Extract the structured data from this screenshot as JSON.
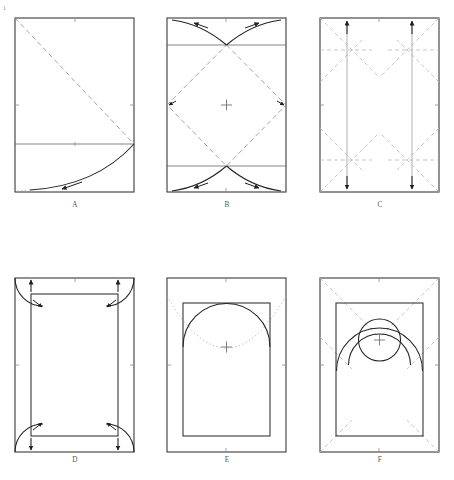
{
  "figure": {
    "canvas": {
      "width": 454,
      "height": 480
    },
    "corner_mark": "1",
    "stroke_colors": {
      "outline": "#3a3a3a",
      "inner_rect": "#2e2e2e",
      "fold_arc": "#232323",
      "guide": "#9a9a9a",
      "guide_dashed": "#8d8d8d",
      "guide_faint": "#b4b4b4",
      "label": "#555555",
      "background": "#ffffff"
    },
    "panels": [
      {
        "id": "A",
        "label": "A",
        "label_x": 75,
        "label_y": 207,
        "rect": {
          "x": 15,
          "y": 18,
          "w": 119,
          "h": 174
        },
        "description": "Diagonal fold from top-left corner to right edge midpoint with swing arc down to bottom edge",
        "horizontal_guide_y": 144,
        "diagonal": {
          "x1": 15,
          "y1": 18,
          "x2": 134,
          "y2": 144
        },
        "swing_arc": {
          "from_x": 134,
          "from_y": 144,
          "to_x": 30,
          "to_y": 190
        },
        "arrow_on_arc": true,
        "ticks": [
          {
            "x": 75,
            "y": 18,
            "dir": "v"
          },
          {
            "x": 15,
            "y": 105,
            "dir": "h"
          },
          {
            "x": 134,
            "y": 105,
            "dir": "h"
          },
          {
            "x": 75,
            "y": 192,
            "dir": "v"
          }
        ]
      },
      {
        "id": "B",
        "label": "B",
        "label_x": 227,
        "label_y": 207,
        "rect": {
          "x": 167,
          "y": 18,
          "w": 119,
          "h": 174
        },
        "description": "Diamond inscribed by four diagonals; arcs swing outward at top and bottom crossings",
        "horizontal_guide_top_y": 45,
        "horizontal_guide_bottom_y": 166,
        "diamond_points": "226.5,45 286,105 226.5,166 167,105",
        "center": {
          "x": 226.5,
          "y": 105
        },
        "arc_pairs": 2,
        "arrows": 4,
        "ticks": [
          {
            "x": 226,
            "y": 18,
            "dir": "v"
          },
          {
            "x": 226,
            "y": 192,
            "dir": "v"
          }
        ]
      },
      {
        "id": "C",
        "label": "C",
        "label_x": 380,
        "label_y": 207,
        "rect": {
          "x": 320,
          "y": 18,
          "w": 119,
          "h": 174
        },
        "description": "Two vertical fold lines with double-headed arrows; faint diagonal creases at each corner zone",
        "vertical_lines": [
          347,
          412
        ],
        "horizontal_crease_top_y": 50,
        "horizontal_crease_bottom_y": 160,
        "arrow_count": 4,
        "diagonal_guides": 8,
        "ticks": [
          {
            "x": 379,
            "y": 18,
            "dir": "v"
          },
          {
            "x": 320,
            "y": 105,
            "dir": "h"
          },
          {
            "x": 439,
            "y": 105,
            "dir": "h"
          }
        ]
      },
      {
        "id": "D",
        "label": "D",
        "label_x": 75,
        "label_y": 462,
        "rect": {
          "x": 15,
          "y": 278,
          "w": 119,
          "h": 174
        },
        "inner_rect": {
          "x": 31,
          "y": 294,
          "w": 87,
          "h": 142
        },
        "description": "Inner panel with quarter-circle corner arcs folded inward; arrows indicate corner tuck direction",
        "corner_arc_radius": 28,
        "arrow_count": 4,
        "ticks": [
          {
            "x": 75,
            "y": 278,
            "dir": "v"
          },
          {
            "x": 15,
            "y": 365,
            "dir": "h"
          },
          {
            "x": 134,
            "y": 365,
            "dir": "h"
          }
        ]
      },
      {
        "id": "E",
        "label": "E",
        "label_x": 227,
        "label_y": 462,
        "rect": {
          "x": 167,
          "y": 278,
          "w": 119,
          "h": 174
        },
        "inner_rect": {
          "x": 183,
          "y": 303,
          "w": 87,
          "h": 133
        },
        "description": "Inner panel topped by a semicircular arch; dotted swing curve sweeps through the arch springing points",
        "arch": {
          "cx": 226.5,
          "cy": 347,
          "r": 43.5
        },
        "center_mark": {
          "x": 226.5,
          "y": 347
        },
        "dotted_curve": true,
        "ticks": [
          {
            "x": 226,
            "y": 278,
            "dir": "v"
          },
          {
            "x": 167,
            "y": 365,
            "dir": "h"
          },
          {
            "x": 286,
            "y": 365,
            "dir": "h"
          },
          {
            "x": 226,
            "y": 452,
            "dir": "v"
          }
        ]
      },
      {
        "id": "F",
        "label": "F",
        "label_x": 380,
        "label_y": 462,
        "rect": {
          "x": 320,
          "y": 278,
          "w": 119,
          "h": 174
        },
        "inner_rect": {
          "x": 336,
          "y": 303,
          "w": 87,
          "h": 133
        },
        "description": "Inner panel with concentric circle and arcs at the head; faint diagonals run to all four corners",
        "circle": {
          "cx": 379.5,
          "cy": 340,
          "r": 21
        },
        "arc_radii": [
          31,
          43
        ],
        "center_mark": {
          "x": 379.5,
          "y": 340
        },
        "diagonal_guides": 4,
        "ticks": [
          {
            "x": 379,
            "y": 278,
            "dir": "v"
          },
          {
            "x": 320,
            "y": 365,
            "dir": "h"
          },
          {
            "x": 439,
            "y": 365,
            "dir": "h"
          },
          {
            "x": 379,
            "y": 452,
            "dir": "v"
          }
        ]
      }
    ]
  }
}
